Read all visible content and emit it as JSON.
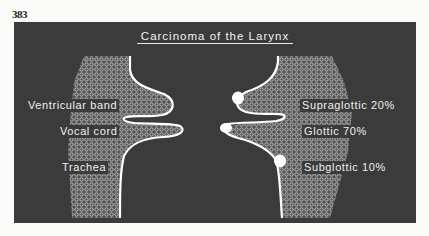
{
  "page_number": "383",
  "diagram": {
    "title": "Carcinoma of the Larynx",
    "left_labels": {
      "ventricular_band": "Ventricular band",
      "vocal_cord": "Vocal cord",
      "trachea": "Trachea"
    },
    "right_labels": {
      "supraglottic": "Supraglottic 20%",
      "glottic": "Glottic 70%",
      "subglottic": "Subglottic 10%"
    },
    "colors": {
      "panel_background": "#3b3b3b",
      "outline": "#ffffff",
      "text": "#f0f0f0",
      "page_background": "#fbfbf9"
    }
  }
}
